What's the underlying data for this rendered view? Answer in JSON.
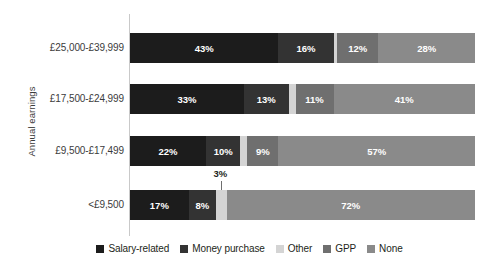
{
  "chart_data": {
    "type": "bar",
    "orientation": "horizontal",
    "stacked": true,
    "stack_normalized_percent": true,
    "title": "",
    "subtitle": "",
    "xlabel": "",
    "ylabel": "Annual earnings",
    "xlim": [
      0,
      100
    ],
    "grid": false,
    "axis_line": "left",
    "legend_position": "bottom",
    "value_suffix": "%",
    "categories": [
      "£25,000-£39,999",
      "£17,500-£24,999",
      "£9,500-£17,499",
      "<£9,500"
    ],
    "series": [
      {
        "name": "Salary-related",
        "color": "#1c1c1c",
        "values": [
          43,
          33,
          22,
          17
        ]
      },
      {
        "name": "Money purchase",
        "color": "#333333",
        "values": [
          16,
          13,
          10,
          8
        ]
      },
      {
        "name": "Other",
        "color": "#d4d4d4",
        "values": [
          1,
          2,
          2,
          3
        ]
      },
      {
        "name": "GPP",
        "color": "#6f6f6f",
        "values": [
          12,
          11,
          9,
          0
        ]
      },
      {
        "name": "None",
        "color": "#8a8a8a",
        "values": [
          28,
          41,
          57,
          72
        ]
      }
    ],
    "bar_labels": [
      [
        {
          "text": "43%",
          "shown": true
        },
        {
          "text": "16%",
          "shown": true
        },
        {
          "text": "",
          "shown": false
        },
        {
          "text": "12%",
          "shown": true
        },
        {
          "text": "28%",
          "shown": true
        }
      ],
      [
        {
          "text": "33%",
          "shown": true
        },
        {
          "text": "13%",
          "shown": true
        },
        {
          "text": "",
          "shown": false
        },
        {
          "text": "11%",
          "shown": true
        },
        {
          "text": "41%",
          "shown": true
        }
      ],
      [
        {
          "text": "22%",
          "shown": true
        },
        {
          "text": "10%",
          "shown": true
        },
        {
          "text": "",
          "shown": false
        },
        {
          "text": "9%",
          "shown": true
        },
        {
          "text": "57%",
          "shown": true
        }
      ],
      [
        {
          "text": "17%",
          "shown": true
        },
        {
          "text": "8%",
          "shown": true
        },
        {
          "text": "",
          "shown": false
        },
        {
          "text": "",
          "shown": false
        },
        {
          "text": "72%",
          "shown": true
        }
      ]
    ],
    "annotations": [
      {
        "text": "3%",
        "points_to_category": "<£9,500",
        "points_to_series": "Other",
        "value": 3
      }
    ]
  },
  "legend": {
    "items": [
      {
        "label": "Salary-related",
        "color": "#1c1c1c"
      },
      {
        "label": "Money purchase",
        "color": "#333333"
      },
      {
        "label": "Other",
        "color": "#d4d4d4"
      },
      {
        "label": "GPP",
        "color": "#6f6f6f"
      },
      {
        "label": "None",
        "color": "#8a8a8a"
      }
    ]
  }
}
